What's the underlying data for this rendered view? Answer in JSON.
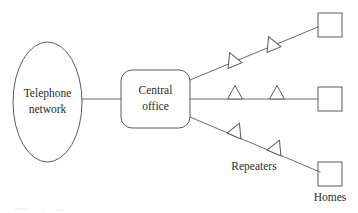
{
  "diagram": {
    "colors": {
      "stroke": "#5a5a62",
      "line": "#6b6b73",
      "text": "#2b2b31",
      "background": "#ffffff"
    },
    "nodes": {
      "telephone_network": {
        "shape": "ellipse",
        "label_line1": "Telephone",
        "label_line2": "network"
      },
      "central_office": {
        "shape": "rounded-rectangle",
        "label_line1": "Central",
        "label_line2": "office"
      },
      "homes": [
        {
          "shape": "square",
          "name": "home-top"
        },
        {
          "shape": "square",
          "name": "home-middle"
        },
        {
          "shape": "square",
          "name": "home-bottom"
        }
      ],
      "repeaters": [
        {
          "shape": "triangle",
          "branch": "top",
          "index": 1
        },
        {
          "shape": "triangle",
          "branch": "top",
          "index": 2
        },
        {
          "shape": "triangle",
          "branch": "middle",
          "index": 1
        },
        {
          "shape": "triangle",
          "branch": "middle",
          "index": 2
        },
        {
          "shape": "triangle",
          "branch": "bottom",
          "index": 1
        },
        {
          "shape": "triangle",
          "branch": "bottom",
          "index": 2
        }
      ]
    },
    "labels": {
      "repeaters": "Repeaters",
      "homes": "Homes"
    },
    "connections": [
      {
        "from": "telephone-network",
        "to": "central-office",
        "style": "straight-horizontal"
      },
      {
        "from": "central-office",
        "to": "home-top",
        "style": "diagonal-up",
        "repeaters": 2
      },
      {
        "from": "central-office",
        "to": "home-middle",
        "style": "straight-horizontal",
        "repeaters": 2
      },
      {
        "from": "central-office",
        "to": "home-bottom",
        "style": "diagonal-down",
        "repeaters": 2
      }
    ]
  }
}
